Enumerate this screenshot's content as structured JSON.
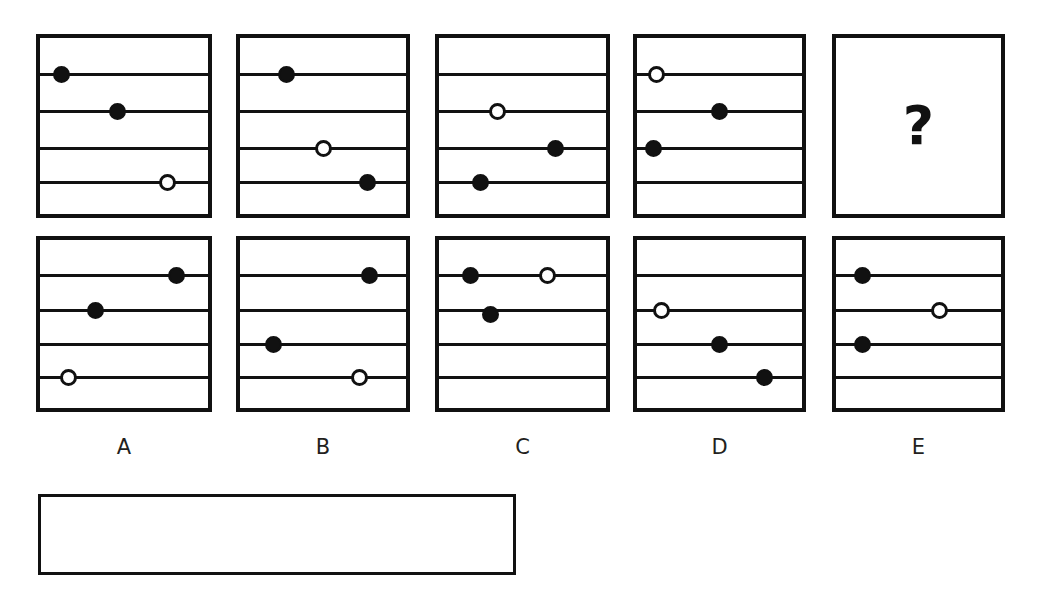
{
  "puzzle": {
    "kind": "visual-analogy-sequence",
    "question_mark": "?",
    "staff_line_count": 4,
    "colors": {
      "ink": "#111111",
      "background": "#ffffff",
      "label_text": "#231f20"
    },
    "sequence": {
      "name": "top-row-sequence",
      "panels": [
        {
          "id": "seq-1",
          "name": "sequence-panel-1",
          "rect": {
            "x": 36,
            "y": 34,
            "w": 176,
            "h": 184
          },
          "lines": [
            0.2,
            0.41,
            0.62,
            0.81
          ],
          "markers": [
            {
              "name": "marker-filled-line1",
              "type": "filled",
              "line": 1,
              "x_pct": 12.5,
              "dy": 0
            },
            {
              "name": "marker-filled-line2",
              "type": "filled",
              "line": 2,
              "x_pct": 46.0,
              "dy": 0
            },
            {
              "name": "marker-open-line4",
              "type": "open",
              "line": 4,
              "x_pct": 76.0,
              "dy": 0
            }
          ]
        },
        {
          "id": "seq-2",
          "name": "sequence-panel-2",
          "rect": {
            "x": 236,
            "y": 34,
            "w": 174,
            "h": 184
          },
          "lines": [
            0.2,
            0.41,
            0.62,
            0.81
          ],
          "markers": [
            {
              "name": "marker-filled-line1",
              "type": "filled",
              "line": 1,
              "x_pct": 28.0,
              "dy": 0
            },
            {
              "name": "marker-open-line3",
              "type": "open",
              "line": 3,
              "x_pct": 50.0,
              "dy": 0
            },
            {
              "name": "marker-filled-line4",
              "type": "filled",
              "line": 4,
              "x_pct": 77.0,
              "dy": 0
            }
          ]
        },
        {
          "id": "seq-3",
          "name": "sequence-panel-3",
          "rect": {
            "x": 435,
            "y": 34,
            "w": 175,
            "h": 184
          },
          "lines": [
            0.2,
            0.41,
            0.62,
            0.81
          ],
          "markers": [
            {
              "name": "marker-open-line2",
              "type": "open",
              "line": 2,
              "x_pct": 35.0,
              "dy": 0
            },
            {
              "name": "marker-filled-line3",
              "type": "filled",
              "line": 3,
              "x_pct": 70.0,
              "dy": 0
            },
            {
              "name": "marker-filled-line4",
              "type": "filled",
              "line": 4,
              "x_pct": 25.0,
              "dy": 0
            }
          ]
        },
        {
          "id": "seq-4",
          "name": "sequence-panel-4",
          "rect": {
            "x": 633,
            "y": 34,
            "w": 173,
            "h": 184
          },
          "lines": [
            0.2,
            0.41,
            0.62,
            0.81
          ],
          "markers": [
            {
              "name": "marker-open-line1",
              "type": "open",
              "line": 1,
              "x_pct": 12.0,
              "dy": 0
            },
            {
              "name": "marker-filled-line2",
              "type": "filled",
              "line": 2,
              "x_pct": 50.0,
              "dy": 0
            },
            {
              "name": "marker-filled-line3",
              "type": "filled",
              "line": 3,
              "x_pct": 10.0,
              "dy": 0
            }
          ]
        },
        {
          "id": "seq-5-unknown",
          "name": "sequence-panel-unknown",
          "rect": {
            "x": 832,
            "y": 34,
            "w": 173,
            "h": 184
          },
          "lines": [],
          "markers": [],
          "is_unknown": true
        }
      ]
    },
    "options": {
      "name": "answer-options-row",
      "panels": [
        {
          "id": "option-a",
          "name": "answer-option-a",
          "label": "A",
          "rect": {
            "x": 36,
            "y": 236,
            "w": 176,
            "h": 176
          },
          "lines": [
            0.205,
            0.41,
            0.615,
            0.81
          ],
          "markers": [
            {
              "name": "marker-filled-line1",
              "type": "filled",
              "line": 1,
              "x_pct": 81.0,
              "dy": 0
            },
            {
              "name": "marker-filled-line2",
              "type": "filled",
              "line": 2,
              "x_pct": 33.0,
              "dy": 0
            },
            {
              "name": "marker-open-line4",
              "type": "open",
              "line": 4,
              "x_pct": 17.0,
              "dy": 0
            }
          ]
        },
        {
          "id": "option-b",
          "name": "answer-option-b",
          "label": "B",
          "rect": {
            "x": 236,
            "y": 236,
            "w": 174,
            "h": 176
          },
          "lines": [
            0.205,
            0.41,
            0.615,
            0.81
          ],
          "markers": [
            {
              "name": "marker-filled-line1",
              "type": "filled",
              "line": 1,
              "x_pct": 78.0,
              "dy": 0
            },
            {
              "name": "marker-filled-line3",
              "type": "filled",
              "line": 3,
              "x_pct": 20.0,
              "dy": 0
            },
            {
              "name": "marker-open-line4",
              "type": "open",
              "line": 4,
              "x_pct": 72.0,
              "dy": 0
            }
          ]
        },
        {
          "id": "option-c",
          "name": "answer-option-c",
          "label": "C",
          "rect": {
            "x": 435,
            "y": 236,
            "w": 175,
            "h": 176
          },
          "lines": [
            0.205,
            0.41,
            0.615,
            0.81
          ],
          "markers": [
            {
              "name": "marker-filled-line1",
              "type": "filled",
              "line": 1,
              "x_pct": 19.0,
              "dy": 0
            },
            {
              "name": "marker-open-line1",
              "type": "open",
              "line": 1,
              "x_pct": 65.0,
              "dy": 0
            },
            {
              "name": "marker-filled-line2",
              "type": "filled",
              "line": 2,
              "x_pct": 31.0,
              "dy": 4
            }
          ]
        },
        {
          "id": "option-d",
          "name": "answer-option-d",
          "label": "D",
          "rect": {
            "x": 633,
            "y": 236,
            "w": 173,
            "h": 176
          },
          "lines": [
            0.205,
            0.41,
            0.615,
            0.81
          ],
          "markers": [
            {
              "name": "marker-open-line2",
              "type": "open",
              "line": 2,
              "x_pct": 15.0,
              "dy": 0
            },
            {
              "name": "marker-filled-line3",
              "type": "filled",
              "line": 3,
              "x_pct": 50.0,
              "dy": 0
            },
            {
              "name": "marker-filled-line4",
              "type": "filled",
              "line": 4,
              "x_pct": 77.0,
              "dy": 0
            }
          ]
        },
        {
          "id": "option-e",
          "name": "answer-option-e",
          "label": "E",
          "rect": {
            "x": 832,
            "y": 236,
            "w": 173,
            "h": 176
          },
          "lines": [
            0.205,
            0.41,
            0.615,
            0.81
          ],
          "markers": [
            {
              "name": "marker-filled-line1",
              "type": "filled",
              "line": 1,
              "x_pct": 16.0,
              "dy": 0
            },
            {
              "name": "marker-open-line2",
              "type": "open",
              "line": 2,
              "x_pct": 63.0,
              "dy": 0
            },
            {
              "name": "marker-filled-line3",
              "type": "filled",
              "line": 3,
              "x_pct": 16.0,
              "dy": 0
            }
          ]
        }
      ]
    },
    "answer_box": {
      "name": "answer-entry-box",
      "rect": {
        "x": 38,
        "y": 494,
        "w": 478,
        "h": 81
      },
      "value": ""
    }
  }
}
